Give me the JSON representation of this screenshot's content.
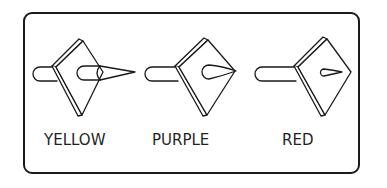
{
  "figure": {
    "items": [
      {
        "label": "YELLOW",
        "tip": "long-cone"
      },
      {
        "label": "PURPLE",
        "tip": "short-teardrop"
      },
      {
        "label": "RED",
        "tip": "small-teardrop"
      }
    ]
  },
  "colors": {
    "ink": "#1a1a1a",
    "background": "#ffffff"
  }
}
